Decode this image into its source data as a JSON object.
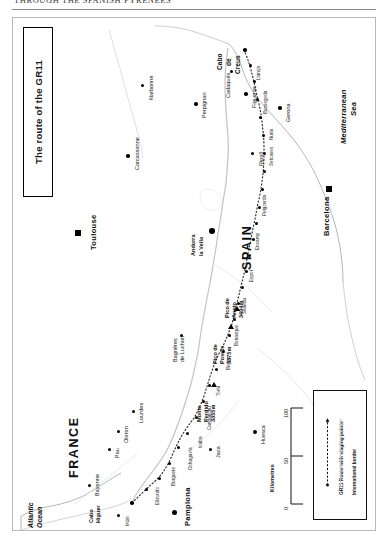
{
  "running_head": {
    "text": "THROUGH THE SPANISH PYRENEES"
  },
  "map": {
    "title": "The route of the GR11",
    "countries": [
      {
        "name": "FRANCE",
        "x": 55,
        "y": 420
      },
      {
        "name": "SPAIN",
        "x": 228,
        "y": 212
      }
    ],
    "water": [
      {
        "name": "Atlantic Ocean",
        "line1": "Atlantic",
        "line2": "Ocean",
        "x": 22,
        "y": 492
      },
      {
        "name": "Mediterranean Sea",
        "line1": "Mediterranean",
        "line2": "Sea",
        "x": 332,
        "y": 96
      }
    ],
    "capes": [
      {
        "name": "Cabo Higuer",
        "line1": "Cabo",
        "line2": "Higuer"
      },
      {
        "name": "Cabo de Creus",
        "line1": "Cabo",
        "line2": "de",
        "line3": "Creus"
      }
    ],
    "major_cities": [
      {
        "name": "Toulouse",
        "marker": "square"
      },
      {
        "name": "Barcelona",
        "marker": "square"
      }
    ],
    "cities": [
      {
        "name": "Bayonne"
      },
      {
        "name": "Irún"
      },
      {
        "name": "Pamplona"
      },
      {
        "name": "Pau"
      },
      {
        "name": "Oloron"
      },
      {
        "name": "Lourdes"
      },
      {
        "name": "Jaca"
      },
      {
        "name": "Huesca"
      },
      {
        "name": "Bagnères de Luchon",
        "line1": "Bagnères",
        "line2": "de Luchon"
      },
      {
        "name": "Andorra la Vella",
        "line1": "Andorra",
        "line2": "la Vella"
      },
      {
        "name": "Carcassonne"
      },
      {
        "name": "Narbonne"
      },
      {
        "name": "Perpignan"
      },
      {
        "name": "Figueras"
      },
      {
        "name": "Gerona"
      },
      {
        "name": "Ripoll"
      },
      {
        "name": "Cadaqués"
      }
    ],
    "peaks": [
      {
        "name": "Monte Perdido",
        "line1": "Monte",
        "line2": "Perdido",
        "height": "3355m"
      },
      {
        "name": "Pico de Posets",
        "line1": "Pico de",
        "line2": "Posets",
        "height": "3375m"
      },
      {
        "name": "Pico de Aneto",
        "line1": "Pico de",
        "line2": "Aneto",
        "height": "3404m"
      }
    ],
    "stage_labels": [
      "Elizondo",
      "Burguete",
      "Ochagavía",
      "Isaba",
      "Candanchú",
      "Torla",
      "Bielsa",
      "Benasque",
      "Salardu",
      "Espot",
      "Encamp",
      "Puigcerdà",
      "Setcases",
      "Nuria",
      "Bassegoda",
      "Llançà"
    ]
  },
  "legend": {
    "entries": [
      {
        "key": "dotted-route-line",
        "label": "GR11 Route with staging points"
      },
      {
        "key": "border-line",
        "label": "International border"
      }
    ]
  },
  "scale": {
    "ticks": [
      "0",
      "50",
      "100"
    ],
    "unit_label": "Kilometres"
  }
}
